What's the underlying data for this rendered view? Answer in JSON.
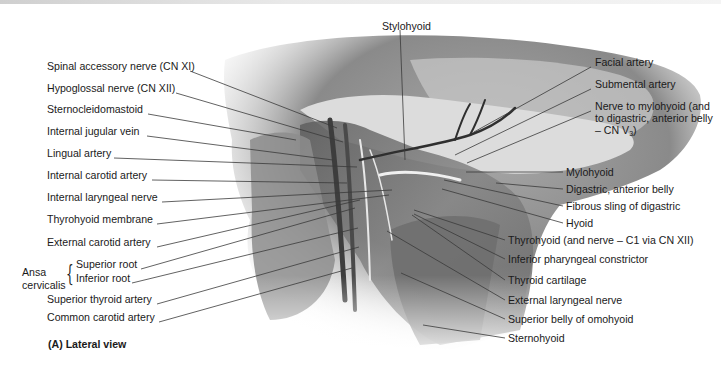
{
  "figure": {
    "caption": "(A) Lateral view",
    "top_label": "Stylohyoid",
    "left_labels": [
      {
        "id": "spinal-accessory-nerve",
        "text": "Spinal accessory nerve (CN XI)",
        "x": 47,
        "y": 66,
        "tx": 337,
        "ty": 128
      },
      {
        "id": "hypoglossal-nerve",
        "text": "Hypoglossal nerve (CN XII)",
        "x": 47,
        "y": 88,
        "tx": 343,
        "ty": 142
      },
      {
        "id": "sternocleidomastoid",
        "text": "Sternocleidomastoid",
        "x": 47,
        "y": 109,
        "tx": 296,
        "ty": 140
      },
      {
        "id": "internal-jugular-vein",
        "text": "Internal jugular vein",
        "x": 47,
        "y": 131,
        "tx": 333,
        "ty": 160
      },
      {
        "id": "lingual-artery",
        "text": "Lingual artery",
        "x": 47,
        "y": 153,
        "tx": 357,
        "ty": 167
      },
      {
        "id": "internal-carotid-artery",
        "text": "Internal carotid artery",
        "x": 47,
        "y": 175,
        "tx": 347,
        "ty": 183
      },
      {
        "id": "internal-laryngeal-nerve",
        "text": "Internal laryngeal nerve",
        "x": 47,
        "y": 197,
        "tx": 392,
        "ty": 190
      },
      {
        "id": "thyrohyoid-membrane",
        "text": "Thyrohyoid membrane",
        "x": 47,
        "y": 219,
        "tx": 389,
        "ty": 195
      },
      {
        "id": "external-carotid-artery",
        "text": "External carotid artery",
        "x": 47,
        "y": 242,
        "tx": 360,
        "ty": 200
      }
    ],
    "ansa_cervicalis": {
      "label_line1": "Ansa",
      "label_line2": "cervicalis",
      "roots": [
        {
          "id": "superior-root",
          "text": "Superior root",
          "x": 76,
          "y": 264,
          "tx": 355,
          "ty": 208
        },
        {
          "id": "inferior-root",
          "text": "Inferior root",
          "x": 76,
          "y": 278,
          "tx": 358,
          "ty": 228
        }
      ]
    },
    "lower_left_labels": [
      {
        "id": "superior-thyroid-artery",
        "text": "Superior thyroid artery",
        "x": 47,
        "y": 299,
        "tx": 359,
        "ty": 247
      },
      {
        "id": "common-carotid-artery",
        "text": "Common carotid artery",
        "x": 47,
        "y": 317,
        "tx": 352,
        "ty": 268
      }
    ],
    "right_labels": [
      {
        "id": "facial-artery",
        "text": "Facial artery",
        "x": 595,
        "y": 62,
        "tx": 474,
        "ty": 132
      },
      {
        "id": "submental-artery",
        "text": "Submental artery",
        "x": 595,
        "y": 84,
        "tx": 455,
        "ty": 155
      },
      {
        "id": "nerve-to-mylohyoid",
        "text": "Nerve to mylohyoid (and to digastric, anterior belly – CN V",
        "subscript": "3",
        "suffix": ")",
        "x": 595,
        "y": 106,
        "tx": 467,
        "ty": 163
      },
      {
        "id": "mylohyoid",
        "text": "Mylohyoid",
        "x": 566,
        "y": 172,
        "tx": 466,
        "ty": 172
      },
      {
        "id": "digastric-anterior-belly",
        "text": "Digastric, anterior belly",
        "x": 566,
        "y": 189,
        "tx": 496,
        "ty": 183
      },
      {
        "id": "fibrous-sling-digastric",
        "text": "Fibrous sling of digastric",
        "x": 566,
        "y": 206,
        "tx": 444,
        "ty": 180
      },
      {
        "id": "hyoid",
        "text": "Hyoid",
        "x": 566,
        "y": 223,
        "tx": 442,
        "ty": 189
      },
      {
        "id": "thyrohyoid",
        "text": "Thyrohyoid (and nerve – C1 via CN XII)",
        "x": 508,
        "y": 240,
        "tx": 414,
        "ty": 210
      },
      {
        "id": "inferior-pharyngeal-constrictor",
        "text": "Inferior pharyngeal constrictor",
        "x": 508,
        "y": 259,
        "tx": 414,
        "ty": 214
      },
      {
        "id": "thyroid-cartilage",
        "text": "Thyroid cartilage",
        "x": 508,
        "y": 280,
        "tx": 412,
        "ty": 215
      },
      {
        "id": "external-laryngeal-nerve",
        "text": "External laryngeal nerve",
        "x": 508,
        "y": 300,
        "tx": 387,
        "ty": 231
      },
      {
        "id": "superior-belly-omohyoid",
        "text": "Superior belly of omohyoid",
        "x": 508,
        "y": 319,
        "tx": 401,
        "ty": 273
      },
      {
        "id": "sternohyoid",
        "text": "Sternohyoid",
        "x": 508,
        "y": 338,
        "tx": 423,
        "ty": 325
      }
    ],
    "colors": {
      "text": "#1a1a1a",
      "leader_line": "#3a3a3a",
      "skin_dark": "#6e6e6e",
      "skin_mid": "#9a9a9a",
      "skin_light": "#cfcfcf",
      "muscle": "#7d7d7d",
      "background": "#ffffff"
    }
  }
}
